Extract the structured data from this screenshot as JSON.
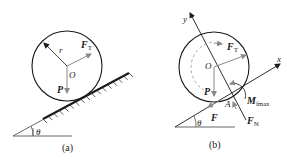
{
  "figure": {
    "panel_a": {
      "caption": "(a)",
      "labels": {
        "radius": "r",
        "force_tension": "F",
        "force_tension_sub": "T",
        "center": "O",
        "weight": "P",
        "angle": "θ"
      }
    },
    "panel_b": {
      "caption": "(b)",
      "labels": {
        "y_axis": "y",
        "x_axis": "x",
        "force_tension": "F",
        "force_tension_sub": "T",
        "center": "O",
        "weight": "P",
        "contact_point": "A",
        "moment": "M",
        "moment_sub": "fmax",
        "friction": "F",
        "normal": "F",
        "normal_sub": "N",
        "angle": "θ"
      }
    },
    "colors": {
      "line": "#1a1a1a",
      "force_arrow": "#8a8a8a",
      "dashed": "#aaaaaa"
    }
  }
}
